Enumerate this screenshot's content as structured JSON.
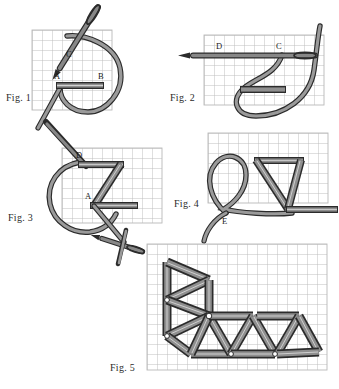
{
  "document": {
    "type": "needlework-stitch-diagram",
    "title": "Chevron / herringbone stitch instruction diagram",
    "background_color": "#ffffff",
    "ink_color": "#2b2b2b",
    "grid_color": "#b9b9b9",
    "thread_fill": "#8a8a8a",
    "thread_outline": "#2b2b2b",
    "needle_fill": "#7e7e7e"
  },
  "figures": [
    {
      "id": "fig1",
      "label": "Fig. 1",
      "grid": {
        "cols": 8,
        "rows": 8,
        "cell": 10
      },
      "point_labels": [
        "C",
        "A",
        "B"
      ],
      "description": "Needle emerging at C with thread loop; horizontal stitch laid between A and B"
    },
    {
      "id": "fig2",
      "label": "Fig. 2",
      "grid": {
        "cols": 12,
        "rows": 8,
        "cell": 10
      },
      "point_labels": [
        "D",
        "C"
      ],
      "description": "Needle passing horizontally through fabric from D to C with thread loop below"
    },
    {
      "id": "fig3",
      "label": "Fig. 3",
      "grid": {
        "cols": 10,
        "rows": 8,
        "cell": 10
      },
      "point_labels": [
        "D",
        "A"
      ],
      "description": "Z-shaped stitch formed between D and A with needle entering from upper left"
    },
    {
      "id": "fig4",
      "label": "Fig. 4",
      "grid": {
        "cols": 12,
        "rows": 8,
        "cell": 10
      },
      "point_labels": [
        "E"
      ],
      "description": "Completed chevron unit with thread loop emerging at E"
    },
    {
      "id": "fig5",
      "label": "Fig. 5",
      "grid": {
        "cols": 18,
        "rows": 12,
        "cell": 10
      },
      "point_labels": [],
      "description": "Finished row of chevron stitches turning a corner, forming triangles"
    }
  ]
}
